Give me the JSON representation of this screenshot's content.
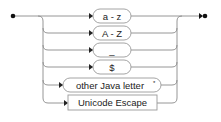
{
  "diagram": {
    "type": "railroad",
    "title": "Java letter",
    "colors": {
      "line": "#8a8a8a",
      "text": "#222222",
      "dot": "#111111",
      "box_border": "#9a9a9a"
    },
    "alternatives": [
      {
        "label": "a - z",
        "kind": "terminal",
        "shape": "rounded"
      },
      {
        "label": "A - Z",
        "kind": "terminal",
        "shape": "rounded"
      },
      {
        "label": "_",
        "kind": "terminal",
        "shape": "rounded"
      },
      {
        "label": "$",
        "kind": "terminal",
        "shape": "rounded"
      },
      {
        "label": "other Java letter",
        "superscript": "*",
        "kind": "terminal",
        "shape": "rounded"
      },
      {
        "label": "Unicode Escape",
        "kind": "nonterminal",
        "shape": "rectangle"
      }
    ]
  }
}
